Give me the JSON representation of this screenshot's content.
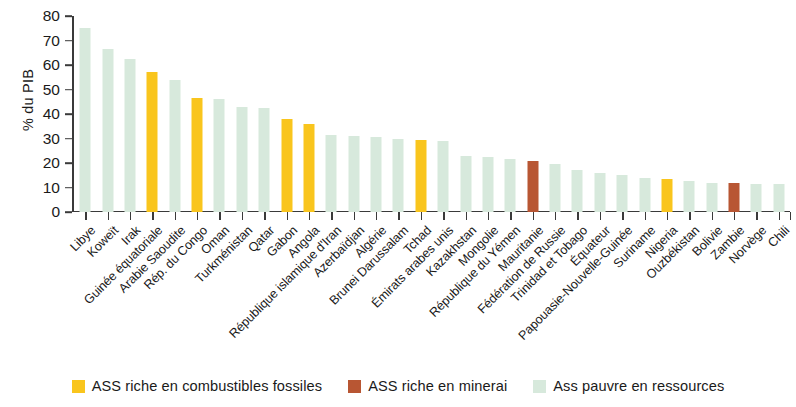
{
  "chart_data": {
    "type": "bar",
    "title": "",
    "subtitle": "",
    "xlabel": "",
    "ylabel": "% du PIB",
    "ylim": [
      0,
      80
    ],
    "yticks": [
      0,
      10,
      20,
      30,
      40,
      50,
      60,
      70,
      80
    ],
    "grid": false,
    "legend_position": "bottom",
    "categories": [
      "Libye",
      "Koweït",
      "Irak",
      "Guinée équatoriale",
      "Arabie Saoudite",
      "Rép. du Congo",
      "Oman",
      "Turkménistan",
      "Qatar",
      "Gabon",
      "Angola",
      "République islamique d'Iran",
      "Azerbaïdjan",
      "Algérie",
      "Brunei Darussalam",
      "Tchad",
      "Émirats arabes unis",
      "Kazakhstan",
      "Mongolie",
      "République du Yémen",
      "Mauritanie",
      "Fédération de Russie",
      "Trinidad et Tobago",
      "Équateur",
      "Papouasie-Nouvelle-Guinée",
      "Suriname",
      "Nigeria",
      "Ouzbékistan",
      "Bolivie",
      "Zambie",
      "Norvège",
      "Chili"
    ],
    "values": [
      75.0,
      66.5,
      62.5,
      57.0,
      54.0,
      46.5,
      46.0,
      43.0,
      42.5,
      38.0,
      36.0,
      31.5,
      31.0,
      30.5,
      30.0,
      29.5,
      29.0,
      23.0,
      22.5,
      21.5,
      21.0,
      19.5,
      17.0,
      16.0,
      15.0,
      14.0,
      13.5,
      12.5,
      12.0,
      12.0,
      11.5,
      11.5
    ],
    "groups": [
      "poor",
      "poor",
      "poor",
      "fossil",
      "poor",
      "fossil",
      "poor",
      "poor",
      "poor",
      "fossil",
      "fossil",
      "poor",
      "poor",
      "poor",
      "poor",
      "fossil",
      "poor",
      "poor",
      "poor",
      "poor",
      "mineral",
      "poor",
      "poor",
      "poor",
      "poor",
      "poor",
      "fossil",
      "poor",
      "poor",
      "mineral",
      "poor",
      "poor"
    ],
    "series": [
      {
        "name": "ASS riche en combustibles fossiles",
        "color": "#f9c51d",
        "members": [
          "Guinée équatoriale",
          "Rép. du Congo",
          "Gabon",
          "Angola",
          "Tchad",
          "Nigeria"
        ]
      },
      {
        "name": "ASS riche en minerai",
        "color": "#b85633",
        "members": [
          "Mauritanie",
          "Zambie"
        ]
      },
      {
        "name": "Ass pauvre en ressources",
        "color": "#d7e9dc",
        "members": [
          "Libye",
          "Koweït",
          "Irak",
          "Arabie Saoudite",
          "Oman",
          "Turkménistan",
          "Qatar",
          "République islamique d'Iran",
          "Azerbaïdjan",
          "Algérie",
          "Brunei Darussalam",
          "Émirats arabes unis",
          "Kazakhstan",
          "Mongolie",
          "République du Yémen",
          "Fédération de Russie",
          "Trinidad et Tobago",
          "Équateur",
          "Papouasie-Nouvelle-Guinée",
          "Suriname",
          "Ouzbékistan",
          "Bolivie",
          "Norvège",
          "Chili"
        ]
      }
    ]
  },
  "axis": {
    "y_title": "% du PIB"
  },
  "legend": {
    "items": [
      {
        "label": "ASS riche en combustibles fossiles",
        "color": "#f9c51d",
        "key": "fossil"
      },
      {
        "label": "ASS riche en minerai",
        "color": "#b85633",
        "key": "mineral"
      },
      {
        "label": "Ass pauvre en ressources",
        "color": "#d7e9dc",
        "key": "poor"
      }
    ]
  }
}
